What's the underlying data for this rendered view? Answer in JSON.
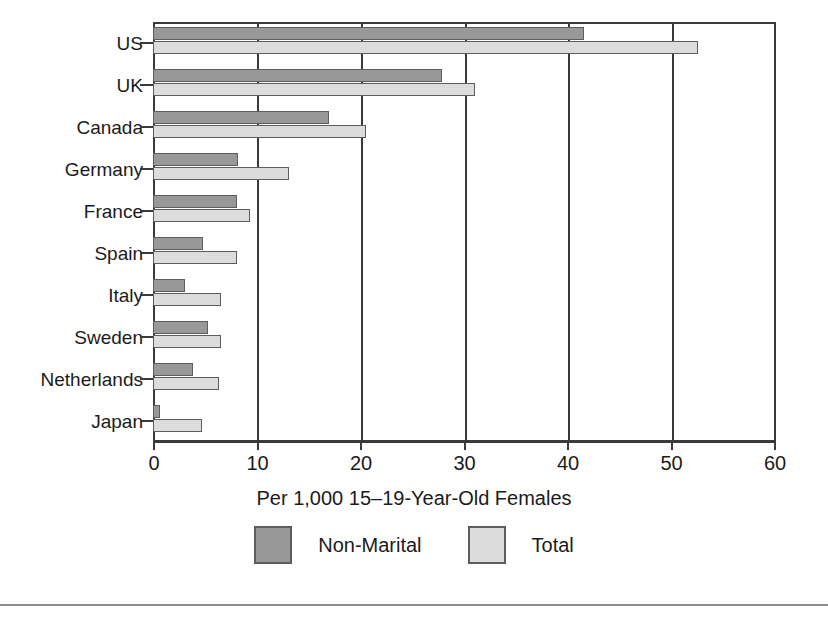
{
  "chart_data": {
    "type": "bar",
    "orientation": "horizontal",
    "title": "",
    "xlabel": "Per 1,000 15–19-Year-Old Females",
    "ylabel": "",
    "xlim": [
      0,
      60
    ],
    "xticks": [
      0,
      10,
      20,
      30,
      40,
      50,
      60
    ],
    "xtick_labels": [
      "0",
      "10",
      "20",
      "30",
      "40",
      "50",
      "60"
    ],
    "grid": true,
    "grid_axis": "x",
    "legend_position": "bottom-center",
    "categories": [
      "US",
      "UK",
      "Canada",
      "Germany",
      "France",
      "Spain",
      "Italy",
      "Sweden",
      "Netherlands",
      "Japan"
    ],
    "series": [
      {
        "name": "Non-Marital",
        "color": "#989898",
        "values": [
          41.6,
          27.9,
          17.0,
          8.2,
          8.1,
          4.8,
          3.1,
          5.3,
          3.9,
          0.7
        ]
      },
      {
        "name": "Total",
        "color": "#dcdcdc",
        "values": [
          52.7,
          31.1,
          20.6,
          13.1,
          9.4,
          8.1,
          6.6,
          6.6,
          6.4,
          4.7
        ]
      }
    ]
  },
  "legend": {
    "items": [
      {
        "label": "Non-Marital",
        "swatch": "#989898"
      },
      {
        "label": "Total",
        "swatch": "#dcdcdc"
      }
    ]
  },
  "colors": {
    "non_marital": "#989898",
    "total": "#dcdcdc",
    "axis": "#3a3a3a",
    "bar_outline": "#5d5d5d",
    "background": "#ffffff",
    "rule": "#8d8d8d"
  }
}
